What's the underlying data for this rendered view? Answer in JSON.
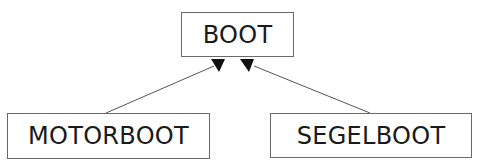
{
  "diagram": {
    "type": "class-inheritance",
    "nodes": [
      {
        "id": "boot",
        "label": "BOOT",
        "role": "parent"
      },
      {
        "id": "motorboot",
        "label": "MOTORBOOT",
        "role": "child"
      },
      {
        "id": "segelboot",
        "label": "SEGELBOOT",
        "role": "child"
      }
    ],
    "edges": [
      {
        "from": "motorboot",
        "to": "boot",
        "arrow": "filled-triangle"
      },
      {
        "from": "segelboot",
        "to": "boot",
        "arrow": "filled-triangle"
      }
    ],
    "colors": {
      "line": "#555555",
      "border": "#6a6a6a",
      "text": "#1a1a1a",
      "arrow": "#111111"
    }
  }
}
